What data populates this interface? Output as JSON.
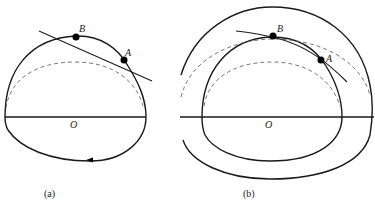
{
  "figure": {
    "panels": [
      {
        "id": "a",
        "caption": "(a)",
        "center_label": "O",
        "points": [
          {
            "label": "B",
            "x": 76,
            "y": 37
          },
          {
            "label": "A",
            "x": 124,
            "y": 60
          }
        ],
        "elements": [
          "outer-boundary",
          "dashed-arc",
          "tangent-line",
          "horizontal-axis",
          "direction-arrow"
        ]
      },
      {
        "id": "b",
        "caption": "(b)",
        "center_label": "O",
        "points": [
          {
            "label": "B",
            "x": 273,
            "y": 36
          },
          {
            "label": "A",
            "x": 321,
            "y": 60
          }
        ],
        "elements": [
          "outer-ring",
          "inner-boundary",
          "outer-dashed-arc",
          "inner-dashed-arc",
          "tangent-line",
          "horizontal-axis"
        ]
      }
    ]
  },
  "colors": {
    "stroke": "#1a1a1a",
    "dashed": "#6a6a6a",
    "background": "#ffffff"
  }
}
